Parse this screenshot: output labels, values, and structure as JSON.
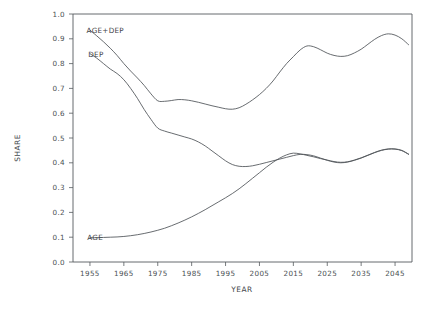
{
  "chart_data": {
    "type": "line",
    "title": "",
    "xlabel": "YEAR",
    "ylabel": "SHARE",
    "xlim": [
      1950,
      2050
    ],
    "ylim": [
      0.0,
      1.0
    ],
    "grid": false,
    "legend_position": "inline-labels",
    "x_ticks": [
      1955,
      1965,
      1975,
      1985,
      1995,
      2005,
      2015,
      2025,
      2035,
      2045
    ],
    "x_tick_labels": [
      "1955",
      "1965",
      "1975",
      "1985",
      "1995",
      "2005",
      "2015",
      "2025",
      "2035",
      "2045"
    ],
    "y_ticks": [
      0.0,
      0.1,
      0.2,
      0.3,
      0.4,
      0.5,
      0.6,
      0.7,
      0.8,
      0.9,
      1.0
    ],
    "y_tick_labels": [
      "0.0",
      "0.1",
      "0.2",
      "0.3",
      "0.4",
      "0.5",
      "0.6",
      "0.7",
      "0.8",
      "0.9",
      "1.0"
    ],
    "annotations": [
      {
        "text": "AGE+DEP",
        "x": 1954.0,
        "y": 0.932,
        "anchor_x": 1956.5,
        "anchor_y": 0.915
      },
      {
        "text": "DEP",
        "x": 1954.5,
        "y": 0.838,
        "anchor_x": 1956.0,
        "anchor_y": 0.822
      },
      {
        "text": "AGE",
        "x": 1954.2,
        "y": 0.1,
        "anchor_x": 1957.0,
        "anchor_y": 0.0985
      }
    ],
    "series": [
      {
        "name": "AGE+DEP",
        "label": "AGE+DEP",
        "color": "#4d5256",
        "x": [
          1955,
          1957,
          1959,
          1961,
          1963,
          1965,
          1967,
          1969,
          1971,
          1973,
          1975,
          1977,
          1979,
          1981,
          1983,
          1985,
          1987,
          1989,
          1991,
          1993,
          1995,
          1997,
          1999,
          2001,
          2003,
          2005,
          2007,
          2009,
          2011,
          2013,
          2015,
          2017,
          2019,
          2021,
          2023,
          2025,
          2027,
          2029,
          2031,
          2033,
          2035,
          2037,
          2039,
          2041,
          2043,
          2045,
          2047,
          2049
        ],
        "values": [
          0.935,
          0.912,
          0.888,
          0.862,
          0.833,
          0.8,
          0.77,
          0.742,
          0.712,
          0.678,
          0.65,
          0.648,
          0.651,
          0.655,
          0.654,
          0.65,
          0.644,
          0.637,
          0.63,
          0.624,
          0.618,
          0.616,
          0.622,
          0.636,
          0.654,
          0.675,
          0.7,
          0.73,
          0.766,
          0.8,
          0.828,
          0.855,
          0.871,
          0.868,
          0.856,
          0.842,
          0.833,
          0.829,
          0.832,
          0.843,
          0.858,
          0.878,
          0.898,
          0.913,
          0.92,
          0.915,
          0.9,
          0.876
        ]
      },
      {
        "name": "DEP",
        "label": "DEP",
        "color": "#4d5256",
        "x": [
          1955,
          1957,
          1959,
          1961,
          1963,
          1965,
          1967,
          1969,
          1971,
          1973,
          1975,
          1977,
          1979,
          1981,
          1983,
          1985,
          1987,
          1989,
          1991,
          1993,
          1995,
          1997,
          1999,
          2001,
          2003,
          2005,
          2007,
          2009,
          2011,
          2013,
          2015,
          2017,
          2019,
          2021,
          2023,
          2025,
          2027,
          2029,
          2031,
          2033,
          2035,
          2037,
          2039,
          2041,
          2043,
          2045,
          2047,
          2049
        ],
        "values": [
          0.84,
          0.822,
          0.8,
          0.778,
          0.76,
          0.735,
          0.7,
          0.66,
          0.615,
          0.575,
          0.54,
          0.528,
          0.52,
          0.512,
          0.504,
          0.496,
          0.484,
          0.468,
          0.448,
          0.428,
          0.408,
          0.393,
          0.386,
          0.385,
          0.388,
          0.394,
          0.401,
          0.408,
          0.415,
          0.422,
          0.429,
          0.434,
          0.433,
          0.428,
          0.419,
          0.41,
          0.403,
          0.4,
          0.403,
          0.41,
          0.419,
          0.43,
          0.441,
          0.45,
          0.455,
          0.455,
          0.449,
          0.434
        ]
      },
      {
        "name": "AGE",
        "label": "AGE",
        "color": "#4d5256",
        "x": [
          1955,
          1957,
          1959,
          1961,
          1963,
          1965,
          1967,
          1969,
          1971,
          1973,
          1975,
          1977,
          1979,
          1981,
          1983,
          1985,
          1987,
          1989,
          1991,
          1993,
          1995,
          1997,
          1999,
          2001,
          2003,
          2005,
          2007,
          2009,
          2011,
          2013,
          2015,
          2017,
          2019,
          2021,
          2023,
          2025,
          2027,
          2029,
          2031,
          2033,
          2035,
          2037,
          2039,
          2041,
          2043,
          2045,
          2047,
          2049
        ],
        "values": [
          0.098,
          0.098,
          0.099,
          0.1,
          0.101,
          0.103,
          0.106,
          0.11,
          0.115,
          0.121,
          0.128,
          0.136,
          0.146,
          0.157,
          0.169,
          0.182,
          0.196,
          0.211,
          0.227,
          0.243,
          0.259,
          0.276,
          0.295,
          0.316,
          0.338,
          0.36,
          0.382,
          0.402,
          0.419,
          0.432,
          0.439,
          0.436,
          0.43,
          0.424,
          0.417,
          0.411,
          0.405,
          0.402,
          0.404,
          0.411,
          0.42,
          0.431,
          0.442,
          0.451,
          0.456,
          0.456,
          0.45,
          0.435
        ]
      }
    ]
  },
  "plot": {
    "left_px": 73,
    "right_px": 412,
    "top_px": 14,
    "bottom_px": 262
  }
}
